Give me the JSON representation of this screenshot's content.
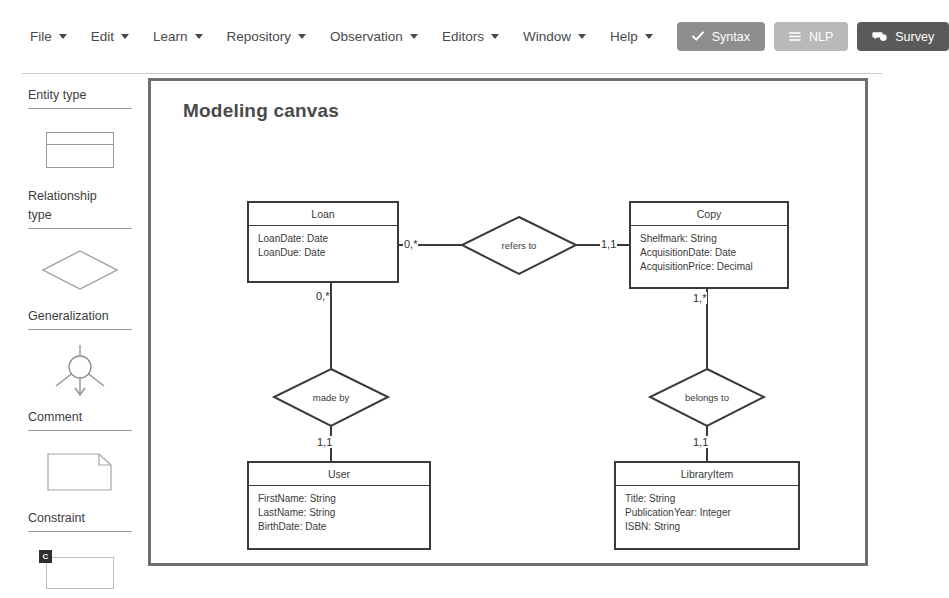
{
  "menu": {
    "items": [
      {
        "label": "File",
        "icon": "chevron-down-icon"
      },
      {
        "label": "Edit",
        "icon": "chevron-down-icon"
      },
      {
        "label": "Learn",
        "icon": "chevron-down-icon"
      },
      {
        "label": "Repository",
        "icon": "chevron-down-icon"
      },
      {
        "label": "Observation",
        "icon": "chevron-down-icon"
      },
      {
        "label": "Editors",
        "icon": "chevron-down-icon"
      },
      {
        "label": "Window",
        "icon": "chevron-down-icon"
      },
      {
        "label": "Help",
        "icon": "chevron-down-icon"
      }
    ],
    "buttons": [
      {
        "label": "Syntax",
        "icon": "check-icon",
        "color": "#8e8e8e"
      },
      {
        "label": "NLP",
        "icon": "list-icon",
        "color": "#b9b9b9"
      },
      {
        "label": "Survey",
        "icon": "comments-icon",
        "color": "#5a5a5a"
      }
    ]
  },
  "palette": {
    "groups": [
      {
        "label": "Entity type",
        "shape": "entity-rectangle-icon"
      },
      {
        "label": "Relationship type",
        "shape": "diamond-icon"
      },
      {
        "label": "Generalization",
        "shape": "generalization-icon"
      },
      {
        "label": "Comment",
        "shape": "comment-note-icon"
      },
      {
        "label": "Constraint",
        "shape": "constraint-icon",
        "badge": "C"
      }
    ]
  },
  "canvas": {
    "title": "Modeling canvas",
    "entities": [
      {
        "name": "Loan",
        "attributes": [
          "LoanDate: Date",
          "LoanDue: Date"
        ]
      },
      {
        "name": "Copy",
        "attributes": [
          "Shelfmark: String",
          "AcquisitionDate: Date",
          "AcquisitionPrice: Decimal"
        ]
      },
      {
        "name": "User",
        "attributes": [
          "FirstName: String",
          "LastName: String",
          "BirthDate: Date"
        ]
      },
      {
        "name": "LibraryItem",
        "attributes": [
          "Title: String",
          "PublicationYear: Integer",
          "ISBN: String"
        ]
      }
    ],
    "relationships": [
      {
        "label": "refers to",
        "from": "Loan",
        "to": "Copy",
        "from_cardinality": "0,*",
        "to_cardinality": "1,1"
      },
      {
        "label": "made by",
        "from": "Loan",
        "to": "User",
        "from_cardinality": "0,*",
        "to_cardinality": "1,1"
      },
      {
        "label": "belongs to",
        "from": "Copy",
        "to": "LibraryItem",
        "from_cardinality": "1,*",
        "to_cardinality": "1,1"
      }
    ]
  }
}
